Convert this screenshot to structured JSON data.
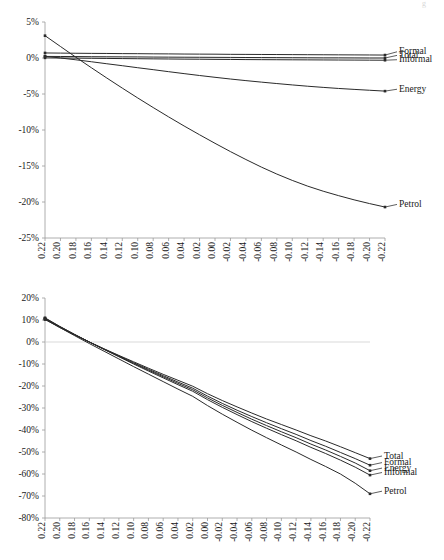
{
  "page": {
    "corner_mark": "g"
  },
  "chart_data": [
    {
      "id": "top",
      "type": "line",
      "title": "",
      "xlabel": "",
      "ylabel": "",
      "grid": false,
      "legend_position": "right-inline",
      "xlim": [
        0.22,
        -0.22
      ],
      "ylim": [
        -25,
        5
      ],
      "ytick_labels": [
        "5%",
        "0%",
        "-5%",
        "-10%",
        "-15%",
        "-20%",
        "-25%"
      ],
      "ytick_values": [
        5,
        0,
        -5,
        -10,
        -15,
        -20,
        -25
      ],
      "x": [
        0.22,
        0.2,
        0.18,
        0.16,
        0.14,
        0.12,
        0.1,
        0.08,
        0.06,
        0.04,
        0.02,
        0.0,
        -0.02,
        -0.04,
        -0.06,
        -0.08,
        -0.1,
        -0.12,
        -0.14,
        -0.16,
        -0.18,
        -0.2,
        -0.22
      ],
      "xtick_labels": [
        "0.22",
        "0.20",
        "0.18",
        "0.16",
        "0.14",
        "0.12",
        "0.10",
        "0.08",
        "0.06",
        "0.04",
        "0.02",
        "0.00",
        "-0.02",
        "-0.04",
        "-0.06",
        "-0.08",
        "-0.10",
        "-0.12",
        "-0.14",
        "-0.16",
        "-0.18",
        "-0.20",
        "-0.22"
      ],
      "series": [
        {
          "name": "Formal",
          "label_y": 0.5,
          "values": [
            0.7,
            0.68,
            0.66,
            0.64,
            0.63,
            0.61,
            0.6,
            0.58,
            0.57,
            0.55,
            0.54,
            0.53,
            0.51,
            0.5,
            0.49,
            0.48,
            0.47,
            0.46,
            0.45,
            0.44,
            0.43,
            0.42,
            0.41
          ]
        },
        {
          "name": "Total",
          "label_y": 0.0,
          "values": [
            0.22,
            0.21,
            0.2,
            0.18,
            0.17,
            0.16,
            0.15,
            0.13,
            0.12,
            0.11,
            0.1,
            0.09,
            0.08,
            0.07,
            0.06,
            0.05,
            0.04,
            0.03,
            0.02,
            0.02,
            0.01,
            0.0,
            0.0
          ]
        },
        {
          "name": "Informal",
          "label_y": -0.6,
          "values": [
            0.02,
            0.0,
            -0.02,
            -0.04,
            -0.06,
            -0.08,
            -0.1,
            -0.12,
            -0.14,
            -0.16,
            -0.17,
            -0.19,
            -0.2,
            -0.22,
            -0.23,
            -0.24,
            -0.25,
            -0.26,
            -0.27,
            -0.28,
            -0.29,
            -0.3,
            -0.31
          ]
        },
        {
          "name": "Energy",
          "label_y": -4.7,
          "values": [
            0.25,
            0.0,
            -0.25,
            -0.52,
            -0.8,
            -1.07,
            -1.35,
            -1.62,
            -1.9,
            -2.17,
            -2.43,
            -2.68,
            -2.92,
            -3.14,
            -3.35,
            -3.55,
            -3.74,
            -3.92,
            -4.08,
            -4.23,
            -4.36,
            -4.48,
            -4.6
          ]
        },
        {
          "name": "Petrol",
          "label_y": -20.7,
          "values": [
            3.1,
            1.6,
            0.1,
            -1.35,
            -2.78,
            -4.18,
            -5.55,
            -6.88,
            -8.18,
            -9.44,
            -10.66,
            -11.85,
            -13.0,
            -14.1,
            -15.15,
            -16.12,
            -17.0,
            -17.8,
            -18.5,
            -19.12,
            -19.7,
            -20.22,
            -20.7
          ]
        }
      ]
    },
    {
      "id": "bottom",
      "type": "line",
      "title": "",
      "xlabel": "",
      "ylabel": "",
      "grid": false,
      "legend_position": "right-inline",
      "xlim": [
        0.22,
        -0.22
      ],
      "ylim": [
        -80,
        20
      ],
      "ytick_labels": [
        "20%",
        "10%",
        "0%",
        "-10%",
        "-20%",
        "-30%",
        "-40%",
        "-50%",
        "-60%",
        "-70%",
        "-80%"
      ],
      "ytick_values": [
        20,
        10,
        0,
        -10,
        -20,
        -30,
        -40,
        -50,
        -60,
        -70,
        -80
      ],
      "x": [
        0.22,
        0.2,
        0.18,
        0.16,
        0.14,
        0.12,
        0.1,
        0.08,
        0.06,
        0.04,
        0.02,
        0.0,
        -0.02,
        -0.04,
        -0.06,
        -0.08,
        -0.1,
        -0.12,
        -0.14,
        -0.16,
        -0.18,
        -0.2,
        -0.22
      ],
      "xtick_labels": [
        "0.22",
        "0.20",
        "0.18",
        "0.16",
        "0.14",
        "0.12",
        "0.10",
        "0.08",
        "0.06",
        "0.04",
        "0.02",
        "0.00",
        "-0.02",
        "-0.04",
        "-0.06",
        "-0.08",
        "-0.10",
        "-0.12",
        "-0.14",
        "-0.16",
        "-0.18",
        "-0.20",
        "-0.22"
      ],
      "series": [
        {
          "name": "Total",
          "label_y": -53.0,
          "values": [
            10.2,
            6.6,
            3.2,
            0.0,
            -3.1,
            -6.1,
            -9.0,
            -11.9,
            -14.7,
            -17.4,
            -20.1,
            -23.5,
            -26.6,
            -29.5,
            -32.3,
            -35.0,
            -37.5,
            -40.0,
            -42.6,
            -45.0,
            -47.6,
            -50.3,
            -53.0
          ]
        },
        {
          "name": "Formal",
          "label_y": -56.0,
          "values": [
            10.6,
            6.9,
            3.3,
            0.0,
            -3.2,
            -6.3,
            -9.4,
            -12.4,
            -15.3,
            -18.2,
            -21.0,
            -24.6,
            -27.9,
            -31.0,
            -33.9,
            -36.7,
            -39.4,
            -42.0,
            -44.8,
            -47.4,
            -50.2,
            -53.0,
            -56.0
          ]
        },
        {
          "name": "Energy",
          "label_y": -58.5,
          "values": [
            10.8,
            7.0,
            3.4,
            0.0,
            -3.3,
            -6.5,
            -9.7,
            -12.8,
            -15.8,
            -18.8,
            -21.7,
            -25.4,
            -28.8,
            -32.0,
            -35.1,
            -38.0,
            -40.8,
            -43.5,
            -46.4,
            -49.1,
            -52.0,
            -55.0,
            -58.5
          ]
        },
        {
          "name": "Informal",
          "label_y": -60.5,
          "values": [
            11.0,
            7.1,
            3.5,
            0.0,
            -3.4,
            -6.7,
            -10.0,
            -13.2,
            -16.3,
            -19.4,
            -22.4,
            -26.2,
            -29.7,
            -33.0,
            -36.2,
            -39.2,
            -42.1,
            -44.9,
            -47.9,
            -50.7,
            -53.7,
            -56.9,
            -60.5
          ]
        },
        {
          "name": "Petrol",
          "label_y": -69.0,
          "values": [
            10.4,
            6.6,
            2.9,
            -0.7,
            -4.2,
            -7.7,
            -11.2,
            -14.6,
            -18.0,
            -21.4,
            -24.7,
            -28.9,
            -32.8,
            -36.5,
            -40.1,
            -43.5,
            -46.8,
            -50.0,
            -53.4,
            -56.6,
            -60.0,
            -64.2,
            -69.0
          ]
        }
      ]
    }
  ]
}
